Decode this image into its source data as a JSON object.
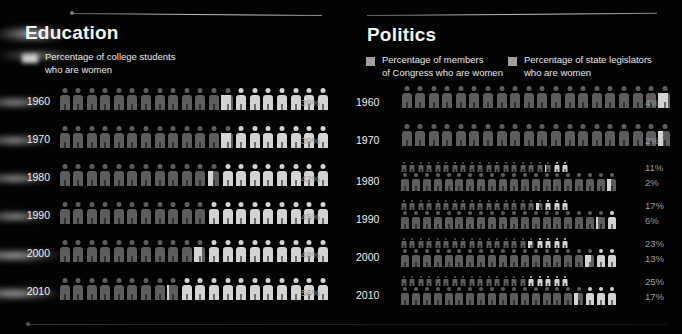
{
  "chart_data": {
    "type": "bar",
    "panels": [
      {
        "id": "education",
        "title": "Education",
        "legend": [
          {
            "label": "Percentage of college students\nwho are women",
            "swatch": "#cfcfcf",
            "style": "blurred"
          }
        ],
        "unit_total": 20,
        "unit_value": 5,
        "categories": [
          "1960",
          "1970",
          "1980",
          "1990",
          "2000",
          "2010"
        ],
        "series": [
          {
            "name": "Percentage of college students who are women",
            "values": [
              39,
              39,
              42,
              45,
              48,
              56
            ],
            "labels": [
              "39%",
              "39%",
              "42%",
              "45%",
              "48%",
              "56%"
            ]
          }
        ]
      },
      {
        "id": "politics",
        "title": "Politics",
        "legend": [
          {
            "label": "Percentage of members\nof Congress who are women",
            "swatch": "#9e9e9e",
            "style": "solid"
          },
          {
            "label": "Percentage of state legislators\nwho are women",
            "swatch": "#9e9e9e",
            "style": "solid"
          }
        ],
        "unit_total": 20,
        "unit_value": 5,
        "categories": [
          "1960",
          "1970",
          "1980",
          "1990",
          "2000",
          "2010"
        ],
        "series": [
          {
            "name": "Percentage of state legislators who are women",
            "values": [
              null,
              null,
              11,
              17,
              23,
              25
            ],
            "labels": [
              "",
              "",
              "11%",
              "17%",
              "23%",
              "25%"
            ]
          },
          {
            "name": "Percentage of members of Congress who are women",
            "values": [
              4,
              2,
              2,
              6,
              13,
              17
            ],
            "labels": [
              "4%",
              "2%",
              "2%",
              "6%",
              "13%",
              "17%"
            ]
          }
        ]
      }
    ],
    "xlabel": "",
    "ylabel": "",
    "grid": false,
    "legend_position": "top"
  },
  "colors": {
    "background": "#030303",
    "figure_base": "#5d5d5d",
    "figure_highlight": "#d3d3d3",
    "text": "#ededed",
    "percent_text": "#9a9a9a",
    "rule": "#cfcfcf"
  },
  "education": {
    "title": "Education",
    "legend": {
      "label": "Percentage of college students\nwho are women"
    },
    "rows": [
      {
        "year": "1960",
        "pct_label": "39%",
        "value": 39
      },
      {
        "year": "1970",
        "pct_label": "39%",
        "value": 39
      },
      {
        "year": "1980",
        "pct_label": "42%",
        "value": 42
      },
      {
        "year": "1990",
        "pct_label": "45%",
        "value": 45
      },
      {
        "year": "2000",
        "pct_label": "48%",
        "value": 48
      },
      {
        "year": "2010",
        "pct_label": "56%",
        "value": 56
      }
    ]
  },
  "politics": {
    "title": "Politics",
    "legend_congress": {
      "label": "Percentage of members\nof Congress who are women"
    },
    "legend_state": {
      "label": "Percentage of state legislators\nwho are women"
    },
    "rows": [
      {
        "year": "1960",
        "state_label": "",
        "state_value": null,
        "congress_label": "4%",
        "congress_value": 4
      },
      {
        "year": "1970",
        "state_label": "",
        "state_value": null,
        "congress_label": "2%",
        "congress_value": 2
      },
      {
        "year": "1980",
        "state_label": "11%",
        "state_value": 11,
        "congress_label": "2%",
        "congress_value": 2
      },
      {
        "year": "1990",
        "state_label": "17%",
        "state_value": 17,
        "congress_label": "6%",
        "congress_value": 6
      },
      {
        "year": "2000",
        "state_label": "23%",
        "state_value": 23,
        "congress_label": "13%",
        "congress_value": 13
      },
      {
        "year": "2010",
        "state_label": "25%",
        "state_value": 25,
        "congress_label": "17%",
        "congress_value": 17
      }
    ]
  }
}
